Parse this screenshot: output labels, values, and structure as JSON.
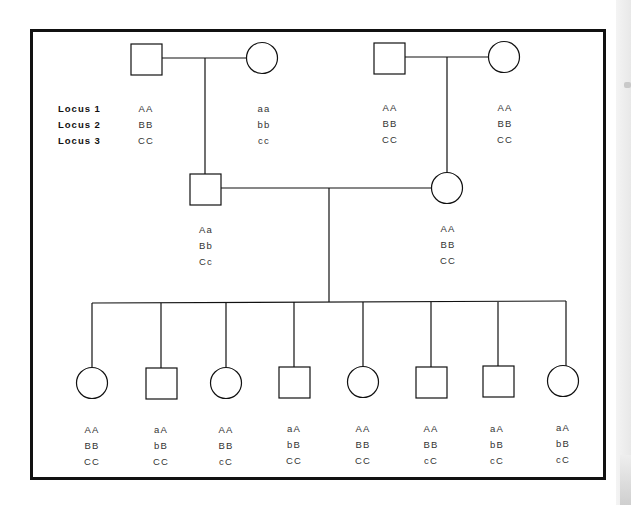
{
  "diagram": {
    "type": "pedigree",
    "locus_labels": [
      "Locus 1",
      "Locus 2",
      "Locus 3"
    ],
    "generation_1": [
      {
        "id": "I-1",
        "sex": "male",
        "shape": "square",
        "genotype": [
          "AA",
          "BB",
          "CC"
        ]
      },
      {
        "id": "I-2",
        "sex": "female",
        "shape": "circle",
        "genotype": [
          "aa",
          "bb",
          "cc"
        ]
      },
      {
        "id": "I-3",
        "sex": "male",
        "shape": "square",
        "genotype": [
          "AA",
          "BB",
          "CC"
        ]
      },
      {
        "id": "I-4",
        "sex": "female",
        "shape": "circle",
        "genotype": [
          "AA",
          "BB",
          "CC"
        ]
      }
    ],
    "generation_2": [
      {
        "id": "II-1",
        "sex": "male",
        "shape": "square",
        "parents": [
          "I-1",
          "I-2"
        ],
        "genotype": [
          "Aa",
          "Bb",
          "Cc"
        ]
      },
      {
        "id": "II-2",
        "sex": "female",
        "shape": "circle",
        "parents": [
          "I-3",
          "I-4"
        ],
        "genotype": [
          "AA",
          "BB",
          "CC"
        ]
      }
    ],
    "generation_3": [
      {
        "id": "III-1",
        "sex": "female",
        "shape": "circle",
        "genotype": [
          "AA",
          "BB",
          "CC"
        ]
      },
      {
        "id": "III-2",
        "sex": "male",
        "shape": "square",
        "genotype": [
          "aA",
          "bB",
          "CC"
        ]
      },
      {
        "id": "III-3",
        "sex": "female",
        "shape": "circle",
        "genotype": [
          "AA",
          "BB",
          "cC"
        ]
      },
      {
        "id": "III-4",
        "sex": "male",
        "shape": "square",
        "genotype": [
          "aA",
          "bB",
          "CC"
        ]
      },
      {
        "id": "III-5",
        "sex": "female",
        "shape": "circle",
        "genotype": [
          "AA",
          "BB",
          "CC"
        ]
      },
      {
        "id": "III-6",
        "sex": "male",
        "shape": "square",
        "genotype": [
          "AA",
          "BB",
          "cC"
        ]
      },
      {
        "id": "III-7",
        "sex": "male",
        "shape": "square",
        "genotype": [
          "aA",
          "bB",
          "cC"
        ]
      },
      {
        "id": "III-8",
        "sex": "female",
        "shape": "circle",
        "genotype": [
          "aA",
          "bB",
          "cC"
        ]
      }
    ],
    "colors": {
      "line": "#111111",
      "text": "#333333",
      "background": "#ffffff"
    }
  }
}
